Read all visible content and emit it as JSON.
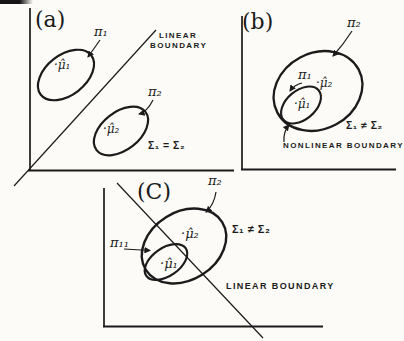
{
  "figure": {
    "ink_color": "#1b1b1b",
    "background_color": "#fcfbf8"
  },
  "panels": {
    "a": {
      "letter": "(a)",
      "pi1": "π₁",
      "pi2": "π₂",
      "mu1": "·μ̂₁",
      "mu2": "·μ̂₂",
      "boundary_line1": "LINEAR",
      "boundary_line2": "BOUNDARY",
      "covariance_note": "Σ₁ = Σ₂"
    },
    "b": {
      "letter": "(b)",
      "pi1": "π₁",
      "pi2": "π₂",
      "mu1": "·μ̂₁",
      "mu2": "·μ̂₂",
      "boundary_label": "NONLINEAR BOUNDARY",
      "covariance_note": "Σ₁ ≠ Σ₂"
    },
    "c": {
      "letter": "(C)",
      "pi1": "π₁₁",
      "pi2": "π₂",
      "mu1": "·μ̂₁",
      "mu2": "·μ̂₂",
      "boundary_label": "LINEAR BOUNDARY",
      "covariance_note": "Σ₁ ≠ Σ₂"
    }
  }
}
